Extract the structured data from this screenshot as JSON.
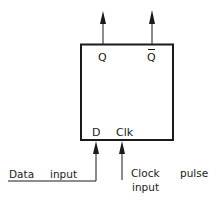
{
  "diagram": {
    "block": {
      "outputs": {
        "q": "Q",
        "q_bar": "Q"
      },
      "inputs": {
        "d": "D",
        "clk": "Clk"
      }
    },
    "labels": {
      "data_input_word1": "Data",
      "data_input_word2": "input",
      "clock_word1": "Clock",
      "clock_word2": "pulse",
      "clock_word3": "input"
    },
    "colors": {
      "stroke": "#1a1a1a",
      "background": "#ffffff"
    }
  }
}
